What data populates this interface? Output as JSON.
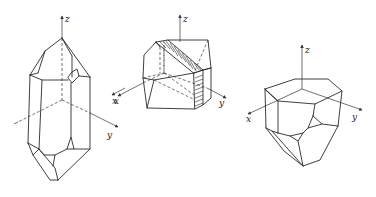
{
  "figure": {
    "crystals": [
      {
        "id": "crystal-1",
        "axis_labels": {
          "z": "z",
          "x": "x",
          "y": "y"
        }
      },
      {
        "id": "crystal-2",
        "axis_labels": {
          "z": "z",
          "x": "x",
          "y": "y"
        },
        "hatched_face": true
      },
      {
        "id": "crystal-3",
        "axis_labels": {
          "z": "z",
          "x": "x",
          "y": "y"
        }
      }
    ]
  },
  "colors": {
    "line": "#2a2a2a",
    "background": "#ffffff"
  }
}
